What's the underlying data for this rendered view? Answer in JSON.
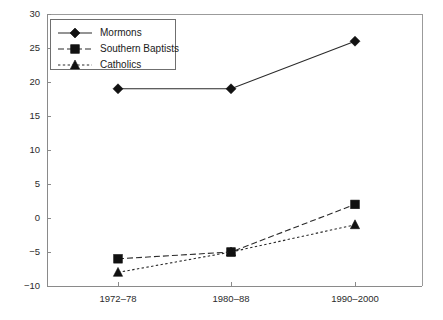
{
  "chart_data": {
    "type": "line",
    "title": "",
    "subtitle": "",
    "xlabel": "",
    "ylabel": "",
    "categories": [
      "1972–78",
      "1980–88",
      "1990–2000"
    ],
    "series": [
      {
        "name": "Mormons",
        "marker": "diamond",
        "linestyle": "solid",
        "color": "#111111",
        "values": [
          19,
          19,
          26
        ]
      },
      {
        "name": "Southern Baptists",
        "marker": "square",
        "linestyle": "dashed",
        "color": "#111111",
        "values": [
          -6,
          -5,
          2
        ]
      },
      {
        "name": "Catholics",
        "marker": "triangle",
        "linestyle": "dotted",
        "color": "#111111",
        "values": [
          -8,
          -5,
          -1
        ]
      }
    ],
    "ylim": [
      -10,
      30
    ],
    "yticks": [
      -10,
      -5,
      0,
      5,
      10,
      15,
      20,
      25,
      30
    ],
    "ytick_labels": [
      "−10",
      "−5",
      "0",
      "5",
      "10",
      "15",
      "20",
      "25",
      "30"
    ],
    "xtick_labels": [
      "1972–78",
      "1980–88",
      "1990–2000"
    ],
    "grid": false,
    "legend_position": "top-left",
    "legend_entries": [
      "Mormons",
      "Southern Baptists",
      "Catholics"
    ],
    "annotations": []
  },
  "axis": {
    "frame_color": "#8a8a8a",
    "text_color": "#2b2b2b"
  }
}
